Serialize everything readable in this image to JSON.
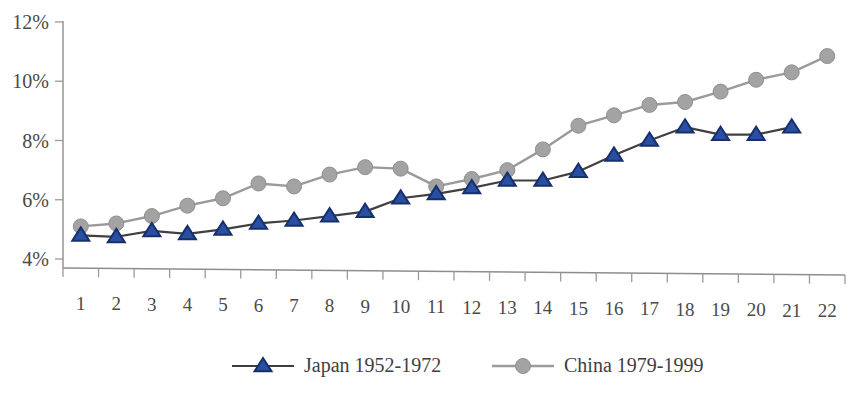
{
  "chart_data": {
    "type": "line",
    "title": "",
    "subtitle": "",
    "xlabel": "",
    "ylabel": "",
    "grid": false,
    "legend_position": "bottom",
    "x": [
      1,
      2,
      3,
      4,
      5,
      6,
      7,
      8,
      9,
      10,
      11,
      12,
      13,
      14,
      15,
      16,
      17,
      18,
      19,
      20,
      21,
      22
    ],
    "categories": [
      "1",
      "2",
      "3",
      "4",
      "5",
      "6",
      "7",
      "8",
      "9",
      "10",
      "11",
      "12",
      "13",
      "14",
      "15",
      "16",
      "17",
      "18",
      "19",
      "20",
      "21",
      "22"
    ],
    "ylim": [
      4,
      12
    ],
    "yticks": [
      4,
      6,
      8,
      10,
      12
    ],
    "ytick_labels": [
      "4%",
      "6%",
      "8%",
      "10%",
      "12%"
    ],
    "series": [
      {
        "name": "Japan 1952-1972",
        "color": "#2a4fa0",
        "line_color": "#404040",
        "marker": "triangle",
        "values": [
          4.8,
          4.75,
          4.95,
          4.85,
          5.0,
          5.2,
          5.3,
          5.45,
          5.6,
          6.05,
          6.2,
          6.4,
          6.65,
          6.65,
          6.95,
          7.5,
          8.0,
          8.45,
          8.2,
          8.2,
          8.45,
          null
        ]
      },
      {
        "name": "China 1979-1999",
        "color": "#a3a3a3",
        "line_color": "#9a9a9a",
        "marker": "circle",
        "values": [
          5.1,
          5.2,
          5.45,
          5.8,
          6.05,
          6.55,
          6.45,
          6.85,
          7.1,
          7.05,
          6.45,
          6.7,
          7.0,
          7.7,
          8.5,
          8.85,
          9.2,
          9.3,
          9.65,
          10.05,
          10.3,
          10.85
        ]
      }
    ]
  },
  "legend": {
    "items": [
      {
        "label": "Japan 1952-1972",
        "marker": "triangle",
        "color": "#2a4fa0"
      },
      {
        "label": "China 1979-1999",
        "marker": "circle",
        "color": "#a3a3a3"
      }
    ]
  },
  "axes": {
    "y_tick_labels": [
      "12%",
      "10%",
      "8%",
      "6%",
      "4%"
    ],
    "x_tick_labels": [
      "1",
      "2",
      "3",
      "4",
      "5",
      "6",
      "7",
      "8",
      "9",
      "10",
      "11",
      "12",
      "13",
      "14",
      "15",
      "16",
      "17",
      "18",
      "19",
      "20",
      "21",
      "22"
    ]
  },
  "colors": {
    "japan_marker": "#2a4fa0",
    "japan_marker_edge": "#16306e",
    "japan_line": "#3d3d3d",
    "china_marker": "#a3a3a3",
    "china_line": "#9b9b9b",
    "axis": "#8d8d8d",
    "text": "#3f3f3f",
    "background": "#ffffff"
  }
}
